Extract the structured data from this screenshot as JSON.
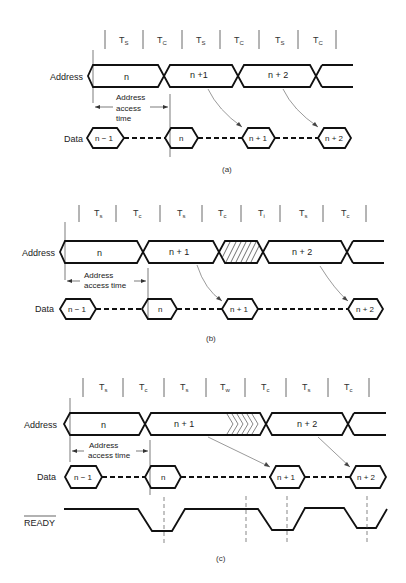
{
  "figure": {
    "panels": [
      {
        "id": "a",
        "caption": "(a)",
        "cycle_labels": [
          {
            "main": "T",
            "sub": "S"
          },
          {
            "main": "T",
            "sub": "C"
          },
          {
            "main": "T",
            "sub": "S"
          },
          {
            "main": "T",
            "sub": "C"
          },
          {
            "main": "T",
            "sub": "S"
          },
          {
            "main": "T",
            "sub": "C"
          }
        ],
        "signals": {
          "address": "Address",
          "data": "Data"
        },
        "address_values": [
          "n",
          "n +1",
          "n + 2"
        ],
        "data_values": [
          "n − 1",
          "n",
          "n + 1",
          "n + 2"
        ],
        "access_time_label": [
          "Address",
          "access",
          "time"
        ]
      },
      {
        "id": "b",
        "caption": "(b)",
        "cycle_labels": [
          {
            "main": "T",
            "sub": "s"
          },
          {
            "main": "T",
            "sub": "c"
          },
          {
            "main": "T",
            "sub": "s"
          },
          {
            "main": "T",
            "sub": "c"
          },
          {
            "main": "T",
            "sub": "i"
          },
          {
            "main": "T",
            "sub": "s"
          },
          {
            "main": "T",
            "sub": "c"
          }
        ],
        "signals": {
          "address": "Address",
          "data": "Data"
        },
        "address_values": [
          "n",
          "n + 1",
          "n + 2"
        ],
        "data_values": [
          "n − 1",
          "n",
          "n + 1",
          "n + 2"
        ],
        "access_time_label": [
          "Address",
          "access time"
        ]
      },
      {
        "id": "c",
        "caption": "(c)",
        "cycle_labels": [
          {
            "main": "T",
            "sub": "s"
          },
          {
            "main": "T",
            "sub": "c"
          },
          {
            "main": "T",
            "sub": "s"
          },
          {
            "main": "T",
            "sub": "w"
          },
          {
            "main": "T",
            "sub": "c"
          },
          {
            "main": "T",
            "sub": "s"
          },
          {
            "main": "T",
            "sub": "c"
          }
        ],
        "signals": {
          "address": "Address",
          "data": "Data",
          "ready": "READY"
        },
        "address_values": [
          "n",
          "n + 1",
          "n + 2"
        ],
        "data_values": [
          "n − 1",
          "n",
          "n + 1",
          "n + 2"
        ],
        "access_time_label": [
          "Address",
          "access time"
        ]
      }
    ]
  }
}
